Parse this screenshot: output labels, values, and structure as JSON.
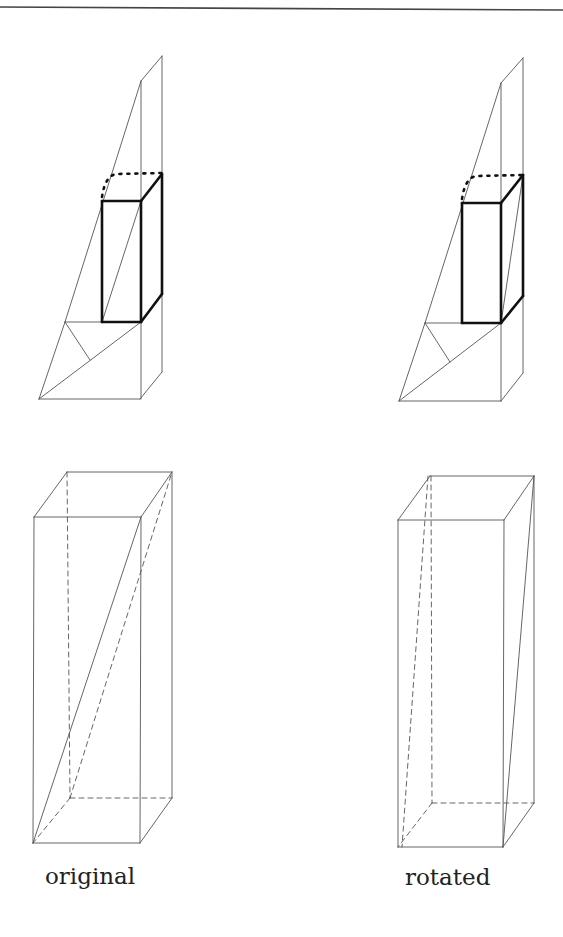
{
  "figure": {
    "top_rule": {
      "x1": 0,
      "y1": 7,
      "x2": 563,
      "y2": 10,
      "color": "#444444",
      "width": 1.6
    },
    "stroke_color": "#555555",
    "bold_color": "#111111",
    "panels": [
      {
        "id": "top-left-wedge",
        "thin": [
          [
            39,
            399,
            140,
            399
          ],
          [
            39,
            399,
            65,
            322
          ],
          [
            65,
            322,
            141,
            81
          ],
          [
            141,
            81,
            162,
            56
          ],
          [
            162,
            56,
            162,
            372
          ],
          [
            141,
            81,
            141,
            399
          ],
          [
            140,
            399,
            162,
            372
          ],
          [
            39,
            399,
            141,
            322
          ],
          [
            65,
            322,
            141,
            322
          ],
          [
            65,
            322,
            90,
            360
          ],
          [
            102,
            322,
            141,
            201
          ]
        ],
        "bold": [
          [
            102,
            201,
            141,
            201
          ],
          [
            102,
            201,
            102,
            322
          ],
          [
            102,
            322,
            141,
            322
          ],
          [
            141,
            201,
            141,
            322
          ],
          [
            141,
            201,
            162,
            174
          ],
          [
            162,
            174,
            162,
            294
          ],
          [
            141,
            322,
            162,
            294
          ]
        ],
        "dotted": "M102,197 Q105,176 116,174 L162,173"
      },
      {
        "id": "top-right-wedge",
        "thin": [
          [
            399,
            401,
            501,
            401
          ],
          [
            399,
            401,
            425,
            323
          ],
          [
            425,
            323,
            501,
            83
          ],
          [
            501,
            83,
            523,
            58
          ],
          [
            523,
            58,
            523,
            373
          ],
          [
            501,
            83,
            501,
            401
          ],
          [
            501,
            401,
            523,
            373
          ],
          [
            399,
            401,
            501,
            323
          ],
          [
            425,
            323,
            501,
            323
          ],
          [
            425,
            323,
            450,
            362
          ],
          [
            501,
            323,
            523,
            175
          ]
        ],
        "bold": [
          [
            462,
            203,
            501,
            203
          ],
          [
            462,
            203,
            462,
            323
          ],
          [
            462,
            323,
            501,
            323
          ],
          [
            501,
            203,
            501,
            323
          ],
          [
            501,
            203,
            523,
            175
          ],
          [
            523,
            175,
            523,
            296
          ],
          [
            501,
            323,
            523,
            296
          ]
        ],
        "dotted": "M462,199 Q465,178 476,176 L523,175"
      },
      {
        "id": "bottom-left-prism",
        "thin": [
          [
            34,
            517,
            141,
            517
          ],
          [
            34,
            517,
            67,
            472
          ],
          [
            67,
            472,
            172,
            472
          ],
          [
            141,
            517,
            172,
            472
          ],
          [
            34,
            517,
            33,
            843
          ],
          [
            141,
            517,
            140,
            843
          ],
          [
            172,
            472,
            172,
            798
          ],
          [
            33,
            843,
            140,
            843
          ],
          [
            140,
            843,
            172,
            798
          ],
          [
            33,
            843,
            141,
            517
          ]
        ],
        "dashed": [
          [
            67,
            472,
            70,
            798
          ],
          [
            70,
            798,
            172,
            798
          ],
          [
            70,
            798,
            33,
            843
          ],
          [
            70,
            798,
            172,
            472
          ]
        ]
      },
      {
        "id": "bottom-right-prism",
        "thin": [
          [
            398,
            520,
            504,
            520
          ],
          [
            398,
            520,
            430,
            476
          ],
          [
            430,
            476,
            534,
            476
          ],
          [
            504,
            520,
            534,
            476
          ],
          [
            398,
            520,
            398,
            847
          ],
          [
            504,
            520,
            503,
            847
          ],
          [
            534,
            476,
            534,
            803
          ],
          [
            398,
            847,
            503,
            847
          ],
          [
            503,
            847,
            534,
            803
          ],
          [
            534,
            476,
            503,
            847
          ]
        ],
        "dashed": [
          [
            431,
            476,
            432,
            803
          ],
          [
            432,
            803,
            534,
            803
          ],
          [
            432,
            803,
            398,
            847
          ],
          [
            428,
            476,
            402,
            847
          ]
        ]
      }
    ],
    "labels": [
      {
        "text": "original",
        "x": 45,
        "y": 865
      },
      {
        "text": "rotated",
        "x": 405,
        "y": 866
      }
    ]
  },
  "labels": {
    "original": "original",
    "rotated": "rotated"
  }
}
